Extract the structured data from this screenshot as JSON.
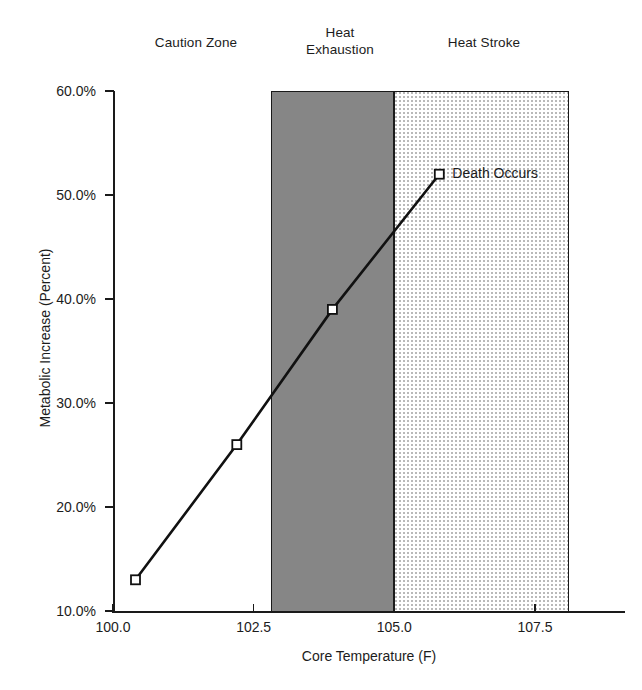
{
  "chart_data": {
    "type": "line",
    "title": "",
    "xlabel": "Core Temperature (F)",
    "ylabel": "Metabolic Increase (Percent)",
    "xlim": [
      100.0,
      109.1
    ],
    "ylim": [
      10.0,
      60.0
    ],
    "grid": false,
    "legend": "none",
    "x_ticks": [
      "100.0",
      "102.5",
      "105.0",
      "107.5"
    ],
    "x_tick_values": [
      100.0,
      102.5,
      105.0,
      107.5
    ],
    "y_ticks": [
      "10.0%",
      "20.0%",
      "30.0%",
      "40.0%",
      "50.0%",
      "60.0%"
    ],
    "y_tick_values": [
      10.0,
      20.0,
      30.0,
      40.0,
      50.0,
      60.0
    ],
    "series": [
      {
        "name": "Metabolic Increase",
        "marker": "open-square",
        "x": [
          100.4,
          102.2,
          103.9,
          105.8
        ],
        "values": [
          13.0,
          26.0,
          39.0,
          52.0
        ]
      }
    ],
    "annotations": [
      {
        "text": "Death Occurs",
        "x": 105.8,
        "y": 52.0
      }
    ],
    "zones": [
      {
        "label": "Caution Zone",
        "x_start": 100.0,
        "x_end": 102.8,
        "fill": "none"
      },
      {
        "label": "Heat\nExhaustion",
        "x_start": 102.8,
        "x_end": 105.0,
        "fill": "#868686"
      },
      {
        "label": "Heat Stroke",
        "x_start": 105.0,
        "x_end": 108.1,
        "fill": "dotted"
      }
    ]
  }
}
